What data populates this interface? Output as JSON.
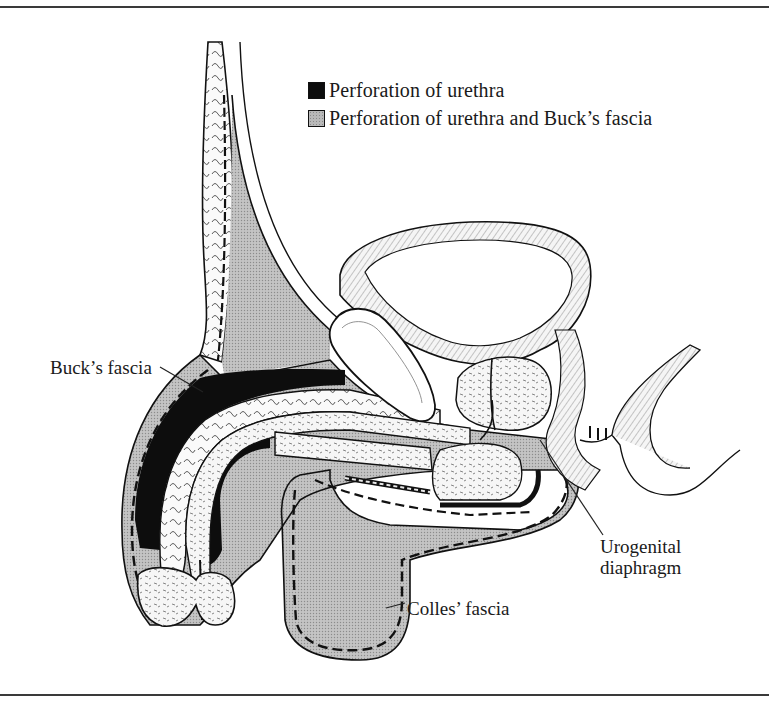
{
  "figure": {
    "type": "anatomical-sagittal-section"
  },
  "legend": [
    {
      "swatch": "black",
      "color": "#0d0d0d",
      "label": "Perforation of urethra"
    },
    {
      "swatch": "stippled-gray",
      "color": "#b9b9b9",
      "label": "Perforation of urethra and Buck’s fascia"
    }
  ],
  "labels": {
    "bucks_fascia": "Buck’s fascia",
    "urogenital_diaphragm_line1": "Urogenital",
    "urogenital_diaphragm_line2": "diaphragm",
    "colles_fascia": "Colles’ fascia"
  },
  "colors": {
    "ink": "#111111",
    "stipple_gray": "#bdbdbd",
    "tissue_light": "#f4f4f4",
    "frame_rule": "#3a3a3a"
  }
}
